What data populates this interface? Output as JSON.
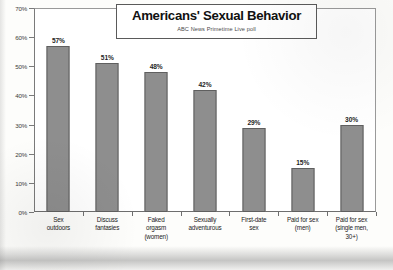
{
  "chart_data": {
    "type": "bar",
    "title": "Americans' Sexual Behavior",
    "subtitle": "ABC News Primetime Live poll",
    "xlabel": "",
    "ylabel": "",
    "ylim": [
      0,
      70
    ],
    "grid": false,
    "legend": "none",
    "y_ticks": [
      "0%",
      "10%",
      "20%",
      "30%",
      "40%",
      "50%",
      "60%",
      "70%"
    ],
    "y_tick_values": [
      0,
      10,
      20,
      30,
      40,
      50,
      60,
      70
    ],
    "categories": [
      "Sex outdoors",
      "Discuss fantasies",
      "Faked orgasm (women)",
      "Sexually adventurous",
      "First-date sex",
      "Paid for sex (men)",
      "Paid for sex (single men, 30+)"
    ],
    "category_lines": [
      [
        "Sex",
        "outdoors"
      ],
      [
        "Discuss",
        "fantasies"
      ],
      [
        "Faked",
        "orgasm",
        "(women)"
      ],
      [
        "Sexually",
        "adventurous"
      ],
      [
        "First-date",
        "sex"
      ],
      [
        "Paid for sex",
        "(men)"
      ],
      [
        "Paid for sex",
        "(single men,",
        "30+)"
      ]
    ],
    "values": [
      57,
      51,
      48,
      42,
      29,
      15,
      30
    ],
    "value_labels": [
      "57%",
      "51%",
      "48%",
      "42%",
      "29%",
      "15%",
      "30%"
    ],
    "bar_color": "#8e8e8e",
    "bar_border_color": "#5f5f5f",
    "axis_color": "#6e6e6e",
    "text_color": "#1f1f1f",
    "background_color": "#ffffff"
  }
}
